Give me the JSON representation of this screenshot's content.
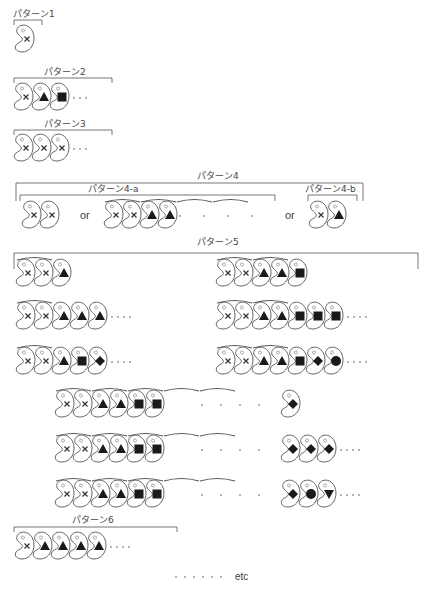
{
  "bean": {
    "width": 19,
    "height": 28,
    "step": 18
  },
  "colors": {
    "line": "#555555",
    "mark": "#1a1a1a",
    "background": "#ffffff"
  },
  "patterns": [
    {
      "id": "p1",
      "label": "パターン1",
      "label_x": 13,
      "label_y": 17,
      "bracket": {
        "x1": 14,
        "x2": 42,
        "y": 20,
        "drop": 5
      },
      "rows": [
        {
          "x": 15,
          "y": 24,
          "beans": [
            "x"
          ],
          "trail_dots": 0
        }
      ]
    },
    {
      "id": "p2",
      "label": "パターン2",
      "label_x": 44,
      "label_y": 75,
      "bracket": {
        "x1": 14,
        "x2": 112,
        "y": 78,
        "drop": 5
      },
      "rows": [
        {
          "x": 14,
          "y": 82,
          "beans": [
            "x",
            "triangle",
            "square"
          ],
          "trail_dots": 3
        }
      ]
    },
    {
      "id": "p3",
      "label": "パターン3",
      "label_x": 44,
      "label_y": 127,
      "bracket": {
        "x1": 14,
        "x2": 112,
        "y": 130,
        "drop": 5
      },
      "rows": [
        {
          "x": 14,
          "y": 133,
          "beans": [
            "x",
            "x",
            "x"
          ],
          "trail_dots": 3
        }
      ]
    },
    {
      "id": "p4",
      "label": "パターン4",
      "label_x": 197,
      "label_y": 179,
      "bracket": {
        "x1": 16,
        "x2": 363,
        "y": 183,
        "drop": 18
      },
      "sub": [
        {
          "id": "p4a",
          "label": "パターン4-a",
          "label_x": 88,
          "label_y": 192,
          "bracket": {
            "x1": 20,
            "x2": 275,
            "y": 195,
            "drop": 6
          }
        },
        {
          "id": "p4b",
          "label": "パターン4-b",
          "label_x": 305,
          "label_y": 192,
          "bracket": {
            "x1": 308,
            "x2": 357,
            "y": 195,
            "drop": 6
          }
        }
      ],
      "rows": [
        {
          "x": 22,
          "y": 200,
          "beans": [
            "x",
            "x"
          ],
          "trail_dots": 0
        },
        {
          "x": 104,
          "y": 200,
          "beans": [
            "x",
            "x",
            "triangle",
            "triangle"
          ],
          "trail_dots": 0,
          "arcs": [
            [
              0,
              1
            ],
            [
              2,
              3
            ],
            [
              4,
              5
            ],
            [
              6,
              7
            ]
          ],
          "mid_dots": {
            "x": 180,
            "count": 4,
            "gap": 24
          }
        },
        {
          "x": 309,
          "y": 200,
          "beans": [
            "x",
            "triangle"
          ],
          "trail_dots": 0
        }
      ],
      "or_labels": [
        {
          "text": "or",
          "x": 80,
          "y": 219
        },
        {
          "text": "or",
          "x": 285,
          "y": 219
        }
      ]
    },
    {
      "id": "p5",
      "label": "パターン5",
      "label_x": 197,
      "label_y": 245,
      "bracket": {
        "x1": 14,
        "x2": 418,
        "y": 253,
        "drop": 16
      },
      "rows": [
        {
          "x": 16,
          "y": 258,
          "beans": [
            "x",
            "x",
            "triangle"
          ],
          "trail_dots": 0,
          "arcs": [
            [
              0,
              1
            ]
          ]
        },
        {
          "x": 216,
          "y": 258,
          "beans": [
            "x",
            "x",
            "triangle",
            "triangle",
            "square"
          ],
          "trail_dots": 0,
          "arcs": [
            [
              0,
              1
            ],
            [
              2,
              3
            ]
          ]
        },
        {
          "x": 16,
          "y": 301,
          "beans": [
            "x",
            "x",
            "triangle",
            "triangle",
            "triangle"
          ],
          "trail_dots": 4,
          "arcs": [
            [
              0,
              1
            ]
          ]
        },
        {
          "x": 216,
          "y": 301,
          "beans": [
            "x",
            "x",
            "triangle",
            "triangle",
            "square",
            "square",
            "square"
          ],
          "trail_dots": 4,
          "arcs": [
            [
              0,
              1
            ],
            [
              2,
              3
            ]
          ]
        },
        {
          "x": 16,
          "y": 346,
          "beans": [
            "x",
            "x",
            "triangle",
            "square",
            "diamond"
          ],
          "trail_dots": 4,
          "arcs": [
            [
              0,
              1
            ]
          ]
        },
        {
          "x": 216,
          "y": 346,
          "beans": [
            "x",
            "x",
            "triangle",
            "triangle",
            "square",
            "diamond",
            "circle"
          ],
          "trail_dots": 4,
          "arcs": [
            [
              0,
              1
            ],
            [
              2,
              3
            ]
          ]
        },
        {
          "x": 55,
          "y": 389,
          "beans": [
            "x",
            "x",
            "triangle",
            "triangle",
            "square",
            "square"
          ],
          "trail_dots": 0,
          "arcs": [
            [
              0,
              1
            ],
            [
              2,
              3
            ],
            [
              4,
              5
            ],
            [
              6,
              7
            ],
            [
              8,
              9
            ]
          ],
          "mid_dots": {
            "x": 202,
            "count": 4,
            "gap": 19
          },
          "tail": {
            "x": 281,
            "beans": [
              "diamond"
            ],
            "trail_dots": 0
          }
        },
        {
          "x": 55,
          "y": 434,
          "beans": [
            "x",
            "x",
            "triangle",
            "triangle",
            "square",
            "square"
          ],
          "trail_dots": 0,
          "arcs": [
            [
              0,
              1
            ],
            [
              2,
              3
            ],
            [
              4,
              5
            ],
            [
              6,
              7
            ],
            [
              8,
              9
            ]
          ],
          "mid_dots": {
            "x": 202,
            "count": 4,
            "gap": 19
          },
          "tail": {
            "x": 281,
            "beans": [
              "diamond",
              "diamond",
              "diamond"
            ],
            "trail_dots": 4
          }
        },
        {
          "x": 55,
          "y": 479,
          "beans": [
            "x",
            "x",
            "triangle",
            "triangle",
            "square",
            "square"
          ],
          "trail_dots": 0,
          "arcs": [
            [
              0,
              1
            ],
            [
              2,
              3
            ],
            [
              4,
              5
            ],
            [
              6,
              7
            ],
            [
              8,
              9
            ]
          ],
          "mid_dots": {
            "x": 202,
            "count": 4,
            "gap": 19
          },
          "tail": {
            "x": 281,
            "beans": [
              "diamond",
              "circle",
              "triangle-down"
            ],
            "trail_dots": 4
          }
        }
      ]
    },
    {
      "id": "p6",
      "label": "パターン6",
      "label_x": 72,
      "label_y": 523,
      "bracket": {
        "x1": 14,
        "x2": 177,
        "y": 527,
        "drop": 5
      },
      "rows": [
        {
          "x": 15,
          "y": 531,
          "beans": [
            "x",
            "triangle",
            "triangle",
            "triangle",
            "triangle"
          ],
          "trail_dots": 4
        }
      ]
    }
  ],
  "footer": {
    "dots": 6,
    "text": "etc",
    "dots_x": 176,
    "text_x": 235,
    "y": 580
  }
}
